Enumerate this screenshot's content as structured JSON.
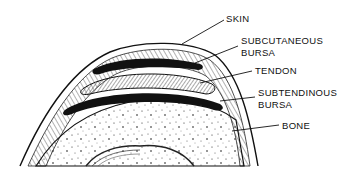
{
  "diagram": {
    "type": "anatomical cross-section",
    "colors": {
      "ink": "#111111",
      "background": "#ffffff",
      "hatch": "#555555"
    },
    "labels": [
      {
        "id": "skin",
        "text": "SKIN"
      },
      {
        "id": "subcutaneous_bursa",
        "line1": "SUBCUTANEOUS",
        "line2": "BURSA"
      },
      {
        "id": "tendon",
        "text": "TENDON"
      },
      {
        "id": "subtendinous_bursa",
        "line1": "SUBTENDINOUS",
        "line2": "BURSA"
      },
      {
        "id": "bone",
        "text": "BONE"
      }
    ]
  }
}
